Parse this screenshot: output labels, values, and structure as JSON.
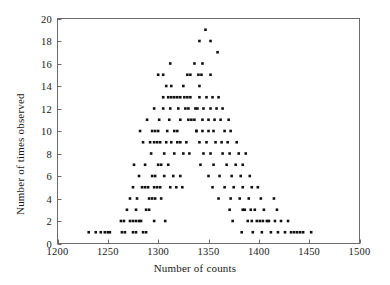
{
  "chart_data": {
    "type": "scatter",
    "title": "",
    "xlabel": "Number of counts",
    "ylabel": "Number of times observed",
    "xlim": [
      1200,
      1500
    ],
    "ylim": [
      0,
      20
    ],
    "xticks": [
      1200,
      1250,
      1300,
      1350,
      1400,
      1450,
      1500
    ],
    "xtick_labels": [
      "1200",
      "1250",
      "1300",
      "1350",
      "1400",
      "1450",
      "1500"
    ],
    "yticks": [
      0,
      2,
      4,
      6,
      8,
      10,
      12,
      14,
      16,
      18,
      20
    ],
    "ytick_labels": [
      "0",
      "2",
      "4",
      "6",
      "8",
      "10",
      "12",
      "14",
      "16",
      "18",
      "20"
    ],
    "grid": false,
    "legend": false,
    "marker": "square",
    "marker_color": "#111111",
    "marker_size": 2.6,
    "points": [
      [
        1231,
        1
      ],
      [
        1238,
        1
      ],
      [
        1243,
        1
      ],
      [
        1247,
        1
      ],
      [
        1250,
        1
      ],
      [
        1252,
        1
      ],
      [
        1264,
        1
      ],
      [
        1267,
        1
      ],
      [
        1275,
        1
      ],
      [
        1278,
        1
      ],
      [
        1285,
        1
      ],
      [
        1288,
        1
      ],
      [
        1263,
        2
      ],
      [
        1266,
        2
      ],
      [
        1272,
        2
      ],
      [
        1275,
        2
      ],
      [
        1278,
        2
      ],
      [
        1281,
        2
      ],
      [
        1283,
        2
      ],
      [
        1296,
        2
      ],
      [
        1307,
        2
      ],
      [
        1269,
        3
      ],
      [
        1278,
        3
      ],
      [
        1288,
        3
      ],
      [
        1291,
        3
      ],
      [
        1272,
        4
      ],
      [
        1279,
        4
      ],
      [
        1291,
        4
      ],
      [
        1294,
        4
      ],
      [
        1297,
        4
      ],
      [
        1303,
        4
      ],
      [
        1275,
        5
      ],
      [
        1284,
        5
      ],
      [
        1287,
        5
      ],
      [
        1290,
        5
      ],
      [
        1296,
        5
      ],
      [
        1299,
        5
      ],
      [
        1302,
        5
      ],
      [
        1312,
        5
      ],
      [
        1318,
        5
      ],
      [
        1324,
        5
      ],
      [
        1281,
        6
      ],
      [
        1294,
        6
      ],
      [
        1297,
        6
      ],
      [
        1306,
        6
      ],
      [
        1315,
        6
      ],
      [
        1322,
        6
      ],
      [
        1276,
        7
      ],
      [
        1287,
        7
      ],
      [
        1300,
        7
      ],
      [
        1303,
        7
      ],
      [
        1310,
        7
      ],
      [
        1293,
        8
      ],
      [
        1306,
        8
      ],
      [
        1316,
        8
      ],
      [
        1325,
        8
      ],
      [
        1331,
        8
      ],
      [
        1285,
        9
      ],
      [
        1292,
        9
      ],
      [
        1296,
        9
      ],
      [
        1299,
        9
      ],
      [
        1302,
        9
      ],
      [
        1308,
        9
      ],
      [
        1313,
        9
      ],
      [
        1319,
        9
      ],
      [
        1322,
        9
      ],
      [
        1328,
        9
      ],
      [
        1282,
        10
      ],
      [
        1294,
        10
      ],
      [
        1297,
        10
      ],
      [
        1300,
        10
      ],
      [
        1309,
        10
      ],
      [
        1316,
        10
      ],
      [
        1319,
        10
      ],
      [
        1338,
        10
      ],
      [
        1289,
        11
      ],
      [
        1301,
        11
      ],
      [
        1311,
        11
      ],
      [
        1322,
        11
      ],
      [
        1330,
        11
      ],
      [
        1333,
        11
      ],
      [
        1344,
        11
      ],
      [
        1296,
        12
      ],
      [
        1305,
        12
      ],
      [
        1312,
        12
      ],
      [
        1320,
        12
      ],
      [
        1327,
        12
      ],
      [
        1330,
        12
      ],
      [
        1339,
        12
      ],
      [
        1305,
        13
      ],
      [
        1310,
        13
      ],
      [
        1313,
        13
      ],
      [
        1316,
        13
      ],
      [
        1319,
        13
      ],
      [
        1322,
        13
      ],
      [
        1326,
        13
      ],
      [
        1329,
        13
      ],
      [
        1332,
        13
      ],
      [
        1341,
        13
      ],
      [
        1348,
        13
      ],
      [
        1354,
        13
      ],
      [
        1360,
        13
      ],
      [
        1308,
        14
      ],
      [
        1313,
        14
      ],
      [
        1325,
        14
      ],
      [
        1341,
        14
      ],
      [
        1300,
        15
      ],
      [
        1305,
        15
      ],
      [
        1329,
        15
      ],
      [
        1332,
        15
      ],
      [
        1340,
        15
      ],
      [
        1343,
        15
      ],
      [
        1352,
        15
      ],
      [
        1312,
        16
      ],
      [
        1336,
        16
      ],
      [
        1344,
        16
      ],
      [
        1359,
        17
      ],
      [
        1341,
        18
      ],
      [
        1352,
        18
      ],
      [
        1347,
        19
      ],
      [
        1337,
        12
      ],
      [
        1345,
        12
      ],
      [
        1352,
        12
      ],
      [
        1358,
        12
      ],
      [
        1364,
        12
      ],
      [
        1336,
        11
      ],
      [
        1350,
        11
      ],
      [
        1356,
        11
      ],
      [
        1362,
        11
      ],
      [
        1370,
        11
      ],
      [
        1338,
        10
      ],
      [
        1344,
        10
      ],
      [
        1350,
        10
      ],
      [
        1355,
        10
      ],
      [
        1366,
        10
      ],
      [
        1372,
        10
      ],
      [
        1341,
        9
      ],
      [
        1348,
        9
      ],
      [
        1357,
        9
      ],
      [
        1363,
        9
      ],
      [
        1369,
        9
      ],
      [
        1378,
        9
      ],
      [
        1345,
        8
      ],
      [
        1352,
        8
      ],
      [
        1364,
        8
      ],
      [
        1371,
        8
      ],
      [
        1380,
        8
      ],
      [
        1387,
        8
      ],
      [
        1342,
        7
      ],
      [
        1355,
        7
      ],
      [
        1368,
        7
      ],
      [
        1377,
        7
      ],
      [
        1384,
        7
      ],
      [
        1350,
        6
      ],
      [
        1361,
        6
      ],
      [
        1373,
        6
      ],
      [
        1382,
        6
      ],
      [
        1391,
        6
      ],
      [
        1354,
        5
      ],
      [
        1366,
        5
      ],
      [
        1375,
        5
      ],
      [
        1384,
        5
      ],
      [
        1393,
        5
      ],
      [
        1399,
        5
      ],
      [
        1360,
        4
      ],
      [
        1372,
        4
      ],
      [
        1381,
        4
      ],
      [
        1390,
        4
      ],
      [
        1402,
        4
      ],
      [
        1415,
        4
      ],
      [
        1371,
        3
      ],
      [
        1384,
        3
      ],
      [
        1396,
        3
      ],
      [
        1405,
        3
      ],
      [
        1418,
        3
      ],
      [
        1374,
        2
      ],
      [
        1389,
        2
      ],
      [
        1398,
        2
      ],
      [
        1404,
        2
      ],
      [
        1410,
        2
      ],
      [
        1416,
        2
      ],
      [
        1422,
        2
      ],
      [
        1429,
        2
      ],
      [
        1383,
        1
      ],
      [
        1394,
        1
      ],
      [
        1403,
        1
      ],
      [
        1412,
        1
      ],
      [
        1419,
        1
      ],
      [
        1426,
        1
      ],
      [
        1432,
        1
      ],
      [
        1435,
        1
      ],
      [
        1438,
        1
      ],
      [
        1441,
        1
      ],
      [
        1444,
        1
      ],
      [
        1452,
        1
      ],
      [
        1393,
        2
      ],
      [
        1401,
        2
      ],
      [
        1408,
        2
      ],
      [
        1386,
        3
      ],
      [
        1392,
        3
      ]
    ]
  },
  "axes": {
    "frame_color": "#6b6b6b",
    "tick_color": "#6b6b6b"
  }
}
